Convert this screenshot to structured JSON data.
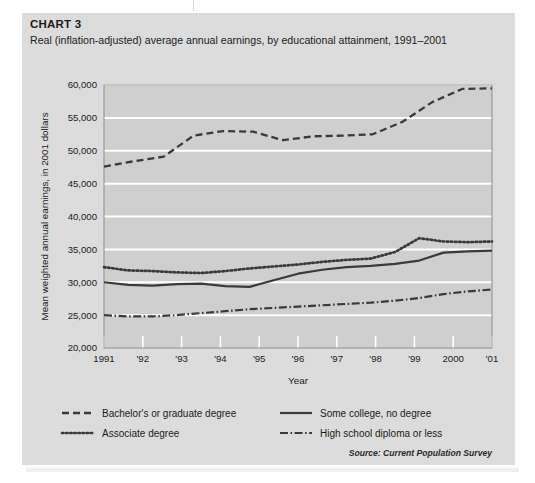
{
  "figure": {
    "label": "CHART 3",
    "title": "Real (inflation-adjusted) average annual earnings, by educational attainment, 1991–2001",
    "source": "Source: Current Population Survey",
    "panel_background": "#dcdcdc",
    "page_background": "#ffffff",
    "ink_color": "#3a3a3a",
    "plot_background": "#cfcfcf",
    "gridline_color": "#ffffff"
  },
  "chart_data": {
    "type": "line",
    "title": "Real (inflation-adjusted) average annual earnings, by educational attainment, 1991–2001",
    "xlabel": "Year",
    "ylabel": "Mean weighted annual earnings, in 2001 dollars",
    "categories": [
      "1991",
      "'92",
      "'93",
      "'94",
      "'95",
      "'96",
      "'97",
      "'98",
      "'99",
      "2000",
      "'01"
    ],
    "x": [
      1991,
      1992,
      1993,
      1994,
      1995,
      1996,
      1997,
      1998,
      1999,
      2000,
      2001
    ],
    "ylim": [
      20000,
      60000
    ],
    "yticks": [
      20000,
      25000,
      30000,
      35000,
      40000,
      45000,
      50000,
      55000,
      60000
    ],
    "ytick_labels": [
      "20,000",
      "25,000",
      "30,000",
      "35,000",
      "40,000",
      "45,000",
      "50,000",
      "55,000",
      "60,000"
    ],
    "grid": true,
    "legend_position": "below",
    "series": [
      {
        "name": "Bachelor's or graduate degree",
        "style": "dashed",
        "dasharray": "7,4",
        "width": 2.2,
        "values": [
          47600,
          48400,
          49100,
          52300,
          53000,
          52900,
          51600,
          52200,
          52300,
          52200,
          54200
        ]
      },
      {
        "name": "Associate degree",
        "style": "dotted",
        "dasharray": "1.6,2.6",
        "width": 2.6,
        "values": [
          32300,
          31800,
          31700,
          31400,
          32100,
          32700,
          33200,
          33500,
          34700,
          36700,
          35800
        ]
      },
      {
        "name": "Some college, no degree",
        "style": "solid",
        "dasharray": "0",
        "width": 2.1,
        "values": [
          30000,
          29500,
          29700,
          29300,
          30700,
          31800,
          32400,
          32700,
          33500,
          34700,
          34700
        ]
      },
      {
        "name": "High school diploma or less",
        "style": "dashdot",
        "dasharray": "8,3,2,3",
        "width": 2.1,
        "values": [
          25000,
          24800,
          25000,
          25500,
          25900,
          26300,
          26700,
          27000,
          27500,
          28200,
          28800
        ]
      }
    ],
    "series_extended_note": "Bachelor's series continues rising to 59,500 by 2001",
    "bachelors_full": [
      47600,
      48400,
      49100,
      52300,
      53000,
      52900,
      51600,
      52200,
      52300,
      52200,
      54200,
      57200,
      59400,
      59500
    ]
  },
  "series_plot": [
    {
      "key": "bachelors",
      "name": "Bachelor's or graduate degree",
      "dasharray": "7,4",
      "width": 2.3,
      "linecap": "butt",
      "values": [
        47600,
        48400,
        49100,
        52300,
        53000,
        52900,
        51600,
        52200,
        52300,
        52500,
        54400,
        57400,
        59400,
        59500
      ]
    },
    {
      "key": "associate",
      "name": "Associate degree",
      "dasharray": "1.5,2.6",
      "width": 2.7,
      "linecap": "round",
      "values": [
        32300,
        31800,
        31700,
        31500,
        31400,
        31700,
        32100,
        32400,
        32700,
        33100,
        33400,
        33600,
        34600,
        36700,
        36200,
        36100,
        36200
      ]
    },
    {
      "key": "somecollege",
      "name": "Some college, no degree",
      "dasharray": "0",
      "width": 2.2,
      "linecap": "butt",
      "values": [
        30000,
        29600,
        29500,
        29700,
        29800,
        29400,
        29300,
        30300,
        31300,
        31900,
        32300,
        32500,
        32800,
        33300,
        34500,
        34700,
        34800
      ]
    },
    {
      "key": "highschool",
      "name": "High school diploma or less",
      "dasharray": "8,2.5,1.6,2.5",
      "width": 2.2,
      "linecap": "butt",
      "values": [
        25000,
        24800,
        24800,
        25000,
        25300,
        25600,
        25900,
        26100,
        26300,
        26500,
        26700,
        26900,
        27200,
        27600,
        28200,
        28600,
        28900
      ]
    }
  ],
  "legend": {
    "items": [
      {
        "label": "Bachelor's or graduate degree",
        "dasharray": "7,4",
        "width": 2.3,
        "column": 0,
        "row": 0
      },
      {
        "label": "Associate degree",
        "dasharray": "1.5,2.6",
        "width": 2.7,
        "column": 0,
        "row": 1
      },
      {
        "label": "Some college, no degree",
        "dasharray": "0",
        "width": 2.2,
        "column": 1,
        "row": 0
      },
      {
        "label": "High school diploma or less",
        "dasharray": "8,2.5,1.6,2.5",
        "width": 2.2,
        "column": 1,
        "row": 1
      }
    ]
  }
}
